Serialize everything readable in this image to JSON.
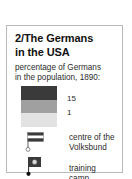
{
  "key": {
    "title_lines": [
      "2/The Germans",
      "in the USA"
    ],
    "caption_lines": [
      "percentage of Germans",
      "in the population, 1890:"
    ],
    "scale": {
      "high_label": "15",
      "low_label": "1",
      "bands": [
        {
          "name": "high",
          "color": "#3a3a3a"
        },
        {
          "name": "mid",
          "color": "#a0a0a0"
        },
        {
          "name": "low",
          "color": "#e2e2e2"
        }
      ]
    },
    "symbols": [
      {
        "icon": "flag-marker-icon",
        "label_lines": [
          "centre of the",
          "Volksbund"
        ]
      },
      {
        "icon": "camp-marker-icon",
        "label_lines": [
          "training camp"
        ]
      }
    ]
  },
  "colors": {
    "border": "#b9b9b9",
    "text": "#2b2b2b",
    "title_text": "#111111",
    "marker_dark": "#3a3a3a",
    "marker_light": "#ffffff"
  }
}
